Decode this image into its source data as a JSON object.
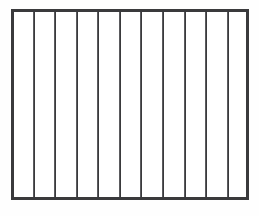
{
  "figure": {
    "canvas": {
      "width": 259,
      "height": 216,
      "background_color": "#fefefe"
    },
    "frame": {
      "left": 11,
      "top": 9,
      "width": 238,
      "height": 191,
      "border_width": 3,
      "border_color": "#3a3a3c",
      "fill_color": "#ffffff"
    },
    "bars": {
      "interior_count": 10,
      "column_count": 11,
      "spacing": 21.5,
      "line_width": 2,
      "line_color": "#3a3a3c",
      "highlight_color": "#5b5b5e",
      "positions": [
        32.6,
        54.2,
        75.7,
        97.3,
        118.8,
        140.4,
        161.9,
        183.5,
        205.0,
        226.6
      ]
    }
  },
  "chart_data": {
    "type": "bar",
    "xlabel": "",
    "ylabel": "",
    "categories": [
      "1",
      "2",
      "3",
      "4",
      "5",
      "6",
      "7",
      "8",
      "9",
      "10",
      "11"
    ],
    "values": [
      1,
      1,
      1,
      1,
      1,
      1,
      1,
      1,
      1,
      1,
      1
    ],
    "ylim": [
      0,
      1
    ],
    "grid": false,
    "legend": false,
    "annotations": []
  }
}
